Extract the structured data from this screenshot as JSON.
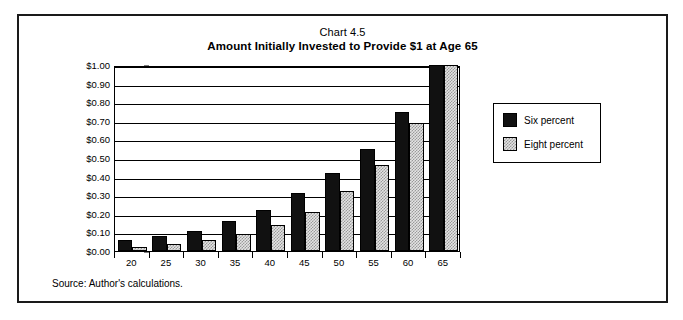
{
  "figure": {
    "title_line1": "Chart 4.5",
    "title_line2": "Amount Initially Invested to Provide $1 at Age 65",
    "source_note": "Source: Author's calculations."
  },
  "legend": {
    "position": "right",
    "entries": [
      {
        "label": "Six  percent",
        "color": "#111111",
        "swatch": "six"
      },
      {
        "label": "Eight percent",
        "color": "#e3e3e3",
        "swatch": "eight"
      }
    ]
  },
  "axis": {
    "y_tick_labels": [
      "$1.00",
      "$0.90",
      "$0.80",
      "$0.70",
      "$0.60",
      "$0.50",
      "$0.40",
      "$0.30",
      "$0.20",
      "$0.10",
      "$0.00"
    ],
    "x_tick_labels": [
      "20",
      "25",
      "30",
      "35",
      "40",
      "45",
      "50",
      "55",
      "60",
      "65"
    ]
  },
  "chart_data": {
    "type": "bar",
    "xlabel": "",
    "ylabel": "",
    "ylim": [
      0,
      1.0
    ],
    "ytick_step": 0.1,
    "grid": true,
    "legend_position": "right",
    "categories": [
      "20",
      "25",
      "30",
      "35",
      "40",
      "45",
      "50",
      "55",
      "60",
      "65"
    ],
    "series": [
      {
        "name": "Six  percent",
        "color": "#111111",
        "values": [
          0.06,
          0.08,
          0.11,
          0.16,
          0.22,
          0.31,
          0.42,
          0.55,
          0.75,
          1.0
        ]
      },
      {
        "name": "Eight percent",
        "color": "#e3e3e3",
        "values": [
          0.02,
          0.04,
          0.06,
          0.09,
          0.14,
          0.21,
          0.32,
          0.46,
          0.69,
          1.0
        ]
      }
    ]
  }
}
